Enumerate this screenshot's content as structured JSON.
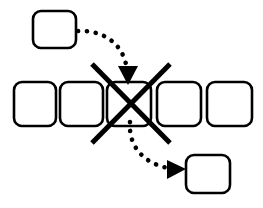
{
  "diagram": {
    "title": "",
    "type": "flow-diagram",
    "background_color": "#ffffff",
    "stroke_color": "#000000",
    "fill_color": "#ffffff",
    "nodes": [
      {
        "id": "source-box",
        "label": "",
        "role": "source",
        "x": 33,
        "y": 11,
        "width": 43,
        "height": 37,
        "radius": 8,
        "stroke_width": 2.6
      },
      {
        "id": "row-box-1",
        "label": "",
        "role": "sequence-item",
        "x": 14,
        "y": 82,
        "width": 42,
        "height": 44,
        "radius": 8,
        "stroke_width": 2.6
      },
      {
        "id": "row-box-2",
        "label": "",
        "role": "sequence-item",
        "x": 60,
        "y": 82,
        "width": 43,
        "height": 44,
        "radius": 8,
        "stroke_width": 2.6
      },
      {
        "id": "row-box-3",
        "label": "",
        "role": "sequence-item-removed",
        "x": 107,
        "y": 82,
        "width": 44,
        "height": 44,
        "radius": 8,
        "stroke_width": 2.6
      },
      {
        "id": "row-box-4",
        "label": "",
        "role": "sequence-item",
        "x": 157,
        "y": 82,
        "width": 44,
        "height": 44,
        "radius": 8,
        "stroke_width": 2.6
      },
      {
        "id": "row-box-5",
        "label": "",
        "role": "sequence-item",
        "x": 207,
        "y": 82,
        "width": 45,
        "height": 44,
        "radius": 8,
        "stroke_width": 2.6
      },
      {
        "id": "destination-box",
        "label": "",
        "role": "destination",
        "x": 186,
        "y": 155,
        "width": 44,
        "height": 38,
        "radius": 8,
        "stroke_width": 2.6
      }
    ],
    "cross_mark": {
      "id": "cross-out-mark",
      "label": "",
      "stroke_width": 5,
      "line_a": {
        "x1": 92,
        "y1": 64,
        "x2": 170,
        "y2": 143
      },
      "line_b": {
        "x1": 170,
        "y1": 64,
        "x2": 92,
        "y2": 143
      }
    },
    "arrows": [
      {
        "id": "insert-arrow",
        "label": "",
        "style": "dotted-curved",
        "from": "source-box",
        "to": "row-box-3",
        "dot_size": 4.6,
        "dash_gap": 4.2,
        "path": "M 78,31 C 104,30 124,44 127,70",
        "head": {
          "tip_x": 128,
          "tip_y": 85,
          "left_x": 118,
          "left_y": 66,
          "right_x": 138,
          "right_y": 66
        }
      },
      {
        "id": "extract-arrow",
        "label": "",
        "style": "dotted-curved",
        "from": "row-box-3",
        "to": "destination-box",
        "dot_size": 4.6,
        "dash_gap": 4.2,
        "path": "M 130,122 C 128,148 146,164 168,168",
        "head": {
          "tip_x": 186,
          "tip_y": 169,
          "left_x": 167,
          "left_y": 160,
          "right_x": 167,
          "right_y": 179
        }
      }
    ]
  }
}
